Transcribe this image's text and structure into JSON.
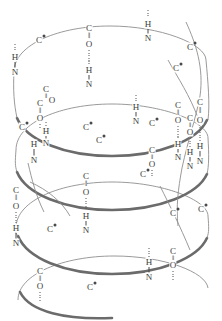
{
  "figure": {
    "colors": {
      "background": "#ffffff",
      "coil_light": "#8f8f8f",
      "coil_dark": "#6b6b6b",
      "atom_text": "#3a3a3a",
      "side_chain_dot": "#4a4a4a",
      "hbond": "#555555"
    }
  },
  "labels": {
    "carbon": "C",
    "nitrogen": "N",
    "oxygen": "O",
    "hydrogen": "H",
    "double_bond": "‖"
  },
  "atoms": [
    {
      "t": "C",
      "x": 39,
      "y": 40,
      "dot": true
    },
    {
      "t": "C",
      "x": 89,
      "y": 28,
      "dot": false
    },
    {
      "t": "O",
      "x": 89,
      "y": 44,
      "dot": false
    },
    {
      "t": "H",
      "x": 89,
      "y": 70,
      "dot": false
    },
    {
      "t": "N",
      "x": 89,
      "y": 84,
      "dot": false
    },
    {
      "t": "H",
      "x": 148,
      "y": 24,
      "dot": false
    },
    {
      "t": "N",
      "x": 148,
      "y": 38,
      "dot": false
    },
    {
      "t": "C",
      "x": 190,
      "y": 47,
      "dot": true
    },
    {
      "t": "C",
      "x": 176,
      "y": 68,
      "dot": true
    },
    {
      "t": "H",
      "x": 15,
      "y": 57,
      "dot": false
    },
    {
      "t": "N",
      "x": 15,
      "y": 72,
      "dot": false
    },
    {
      "t": "C",
      "x": 46,
      "y": 89,
      "dot": false
    },
    {
      "t": "O",
      "x": 52,
      "y": 100,
      "dot": false
    },
    {
      "t": "C",
      "x": 40,
      "y": 103,
      "dot": false
    },
    {
      "t": "O",
      "x": 40,
      "y": 118,
      "dot": false
    },
    {
      "t": "H",
      "x": 46,
      "y": 131,
      "dot": false
    },
    {
      "t": "N",
      "x": 46,
      "y": 143,
      "dot": false
    },
    {
      "t": "H",
      "x": 34,
      "y": 144,
      "dot": false
    },
    {
      "t": "N",
      "x": 34,
      "y": 160,
      "dot": false
    },
    {
      "t": "C",
      "x": 22,
      "y": 127,
      "dot": true
    },
    {
      "t": "C",
      "x": 86,
      "y": 127,
      "dot": true
    },
    {
      "t": "C",
      "x": 99,
      "y": 140,
      "dot": true
    },
    {
      "t": "C",
      "x": 152,
      "y": 123,
      "dot": true
    },
    {
      "t": "H",
      "x": 136,
      "y": 107,
      "dot": false
    },
    {
      "t": "N",
      "x": 136,
      "y": 121,
      "dot": false
    },
    {
      "t": "C",
      "x": 178,
      "y": 105,
      "dot": false
    },
    {
      "t": "O",
      "x": 178,
      "y": 120,
      "dot": false
    },
    {
      "t": "H",
      "x": 178,
      "y": 144,
      "dot": false
    },
    {
      "t": "N",
      "x": 178,
      "y": 157,
      "dot": false
    },
    {
      "t": "C",
      "x": 200,
      "y": 102,
      "dot": false
    },
    {
      "t": "O",
      "x": 200,
      "y": 120,
      "dot": false
    },
    {
      "t": "H",
      "x": 200,
      "y": 146,
      "dot": false
    },
    {
      "t": "N",
      "x": 200,
      "y": 161,
      "dot": false
    },
    {
      "t": "C",
      "x": 190,
      "y": 118,
      "dot": false
    },
    {
      "t": "O",
      "x": 190,
      "y": 132,
      "dot": false
    },
    {
      "t": "H",
      "x": 190,
      "y": 152,
      "dot": false
    },
    {
      "t": "N",
      "x": 190,
      "y": 166,
      "dot": false
    },
    {
      "t": "C",
      "x": 152,
      "y": 150,
      "dot": false
    },
    {
      "t": "O",
      "x": 152,
      "y": 164,
      "dot": false
    },
    {
      "t": "C",
      "x": 143,
      "y": 174,
      "dot": true
    },
    {
      "t": "C",
      "x": 86,
      "y": 176,
      "dot": false
    },
    {
      "t": "O",
      "x": 86,
      "y": 192,
      "dot": false
    },
    {
      "t": "H",
      "x": 86,
      "y": 216,
      "dot": false
    },
    {
      "t": "N",
      "x": 86,
      "y": 230,
      "dot": false
    },
    {
      "t": "C",
      "x": 16,
      "y": 190,
      "dot": false
    },
    {
      "t": "O",
      "x": 16,
      "y": 206,
      "dot": false
    },
    {
      "t": "H",
      "x": 16,
      "y": 228,
      "dot": false
    },
    {
      "t": "N",
      "x": 16,
      "y": 243,
      "dot": false
    },
    {
      "t": "C",
      "x": 50,
      "y": 229,
      "dot": true
    },
    {
      "t": "C",
      "x": 173,
      "y": 213,
      "dot": true
    },
    {
      "t": "C",
      "x": 201,
      "y": 209,
      "dot": true
    },
    {
      "t": "C",
      "x": 173,
      "y": 251,
      "dot": false
    },
    {
      "t": "O",
      "x": 173,
      "y": 265,
      "dot": false
    },
    {
      "t": "C",
      "x": 40,
      "y": 271,
      "dot": false
    },
    {
      "t": "O",
      "x": 40,
      "y": 286,
      "dot": false
    },
    {
      "t": "C",
      "x": 90,
      "y": 287,
      "dot": true
    },
    {
      "t": "N",
      "x": 149,
      "y": 277,
      "dot": false
    },
    {
      "t": "H",
      "x": 149,
      "y": 262,
      "dot": false
    }
  ],
  "notes": {
    "turns": 4,
    "hbond_count": 10,
    "ca_dot_meaning": "filled dot marks alpha-carbon side-chain attachment"
  }
}
